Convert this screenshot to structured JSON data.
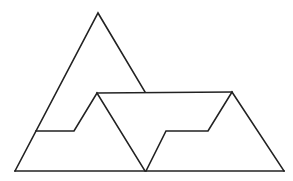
{
  "figure": {
    "stroke_color": "#222222",
    "background_color": "#ffffff",
    "shapes": [
      {
        "name": "outer-left-edge",
        "points": "15,171 98,13 145,92"
      },
      {
        "name": "top-band-line",
        "points": "97,93 232,92"
      },
      {
        "name": "left-step",
        "points": "36,131 74,131 97,93 145,171"
      },
      {
        "name": "bottom-base",
        "points": "15,171 284,171"
      },
      {
        "name": "right-step",
        "points": "146,171 166,131 208,131 232,92 284,171"
      }
    ]
  }
}
